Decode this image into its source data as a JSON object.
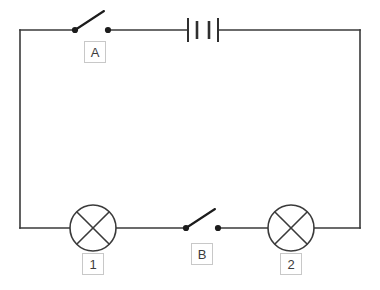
{
  "diagram": {
    "type": "circuit-schematic",
    "colors": {
      "wire": "#3a3a3a",
      "component": "#1c1c1c",
      "label_border": "#c8c8c8",
      "label_text": "#3c3c3c",
      "background": "#ffffff"
    },
    "loop": {
      "left": 20,
      "right": 360,
      "top": 30,
      "bottom": 228
    },
    "components": [
      {
        "id": "switch-a",
        "kind": "switch",
        "label": "A",
        "state": "open",
        "position": "top-branch",
        "left_terminal_x": 75,
        "right_terminal_x": 108,
        "wire_y": 30,
        "label_box": {
          "x": 84,
          "y": 41
        }
      },
      {
        "id": "battery",
        "kind": "battery",
        "cells": 2,
        "plates": 4,
        "position": "top-branch",
        "center_x": 203,
        "wire_y": 30
      },
      {
        "id": "lamp-1",
        "kind": "lamp",
        "label": "1",
        "position": "bottom-branch-left",
        "center_x": 93,
        "center_y": 228,
        "radius": 23,
        "label_box": {
          "x": 82,
          "y": 253
        }
      },
      {
        "id": "switch-b",
        "kind": "switch",
        "label": "B",
        "state": "open",
        "position": "bottom-branch-middle",
        "left_terminal_x": 186,
        "right_terminal_x": 218,
        "wire_y": 228,
        "label_box": {
          "x": 191,
          "y": 243
        }
      },
      {
        "id": "lamp-2",
        "kind": "lamp",
        "label": "2",
        "position": "bottom-branch-right",
        "center_x": 291,
        "center_y": 228,
        "radius": 23,
        "label_box": {
          "x": 280,
          "y": 253
        }
      }
    ],
    "labels": {
      "switch_a": "A",
      "switch_b": "B",
      "lamp_1": "1",
      "lamp_2": "2"
    }
  }
}
